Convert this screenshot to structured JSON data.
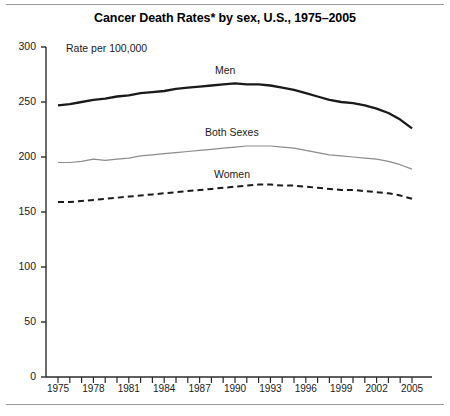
{
  "figure": {
    "title": "Cancer Death Rates* by sex, U.S., 1975–2005",
    "y_axis_unit_label": "Rate per 100,000",
    "rules": {
      "top": "divider-line",
      "bottom": "divider-line"
    }
  },
  "chart_data": {
    "type": "line",
    "title": "Cancer Death Rates* by sex, U.S., 1975–2005",
    "subtitle": "",
    "xlabel": "",
    "ylabel": "Rate per 100,000",
    "xlim": [
      1975,
      2005
    ],
    "ylim": [
      0,
      300
    ],
    "yticks": [
      0,
      50,
      100,
      150,
      200,
      250,
      300
    ],
    "ytick_labels": [
      "0",
      "50",
      "100",
      "150",
      "200",
      "250",
      "300"
    ],
    "xticks": [
      1975,
      1976,
      1977,
      1978,
      1979,
      1980,
      1981,
      1982,
      1983,
      1984,
      1985,
      1986,
      1987,
      1988,
      1989,
      1990,
      1991,
      1992,
      1993,
      1994,
      1995,
      1996,
      1997,
      1998,
      1999,
      2000,
      2001,
      2002,
      2003,
      2004,
      2005
    ],
    "xtick_labels_shown": [
      "1975",
      "1978",
      "1981",
      "1984",
      "1987",
      "1990",
      "1993",
      "1996",
      "1999",
      "2002",
      "2005"
    ],
    "grid": false,
    "legend_position": "inline-annotations",
    "x": [
      1975,
      1976,
      1977,
      1978,
      1979,
      1980,
      1981,
      1982,
      1983,
      1984,
      1985,
      1986,
      1987,
      1988,
      1989,
      1990,
      1991,
      1992,
      1993,
      1994,
      1995,
      1996,
      1997,
      1998,
      1999,
      2000,
      2001,
      2002,
      2003,
      2004,
      2005
    ],
    "series": [
      {
        "name": "Men",
        "style": "solid-thick",
        "color": "#1a1a1a",
        "label_text": "Men",
        "values": [
          247,
          248,
          250,
          252,
          253,
          255,
          256,
          258,
          259,
          260,
          262,
          263,
          264,
          265,
          266,
          267,
          266,
          266,
          265,
          263,
          261,
          258,
          255,
          252,
          250,
          249,
          247,
          244,
          240,
          234,
          226
        ]
      },
      {
        "name": "Both Sexes",
        "style": "solid-thin",
        "color": "#8c8c8c",
        "label_text": "Both Sexes",
        "values": [
          195,
          195,
          196,
          198,
          197,
          198,
          199,
          201,
          202,
          203,
          204,
          205,
          206,
          207,
          208,
          209,
          210,
          210,
          210,
          209,
          208,
          206,
          204,
          202,
          201,
          200,
          199,
          198,
          196,
          193,
          189
        ]
      },
      {
        "name": "Women",
        "style": "dashed",
        "color": "#1a1a1a",
        "label_text": "Women",
        "values": [
          159,
          159,
          160,
          161,
          162,
          163,
          164,
          165,
          166,
          167,
          168,
          169,
          170,
          171,
          172,
          173,
          174,
          175,
          175,
          174,
          174,
          173,
          172,
          171,
          170,
          170,
          169,
          168,
          167,
          165,
          162
        ]
      }
    ]
  }
}
